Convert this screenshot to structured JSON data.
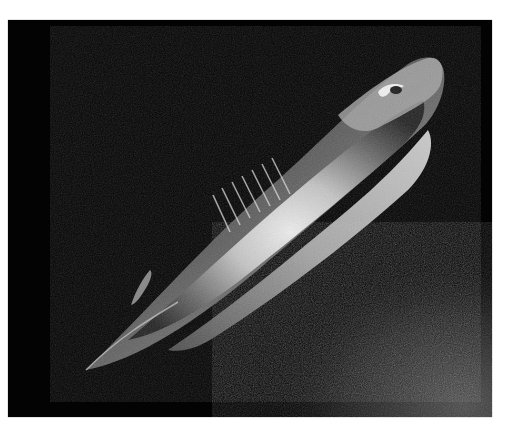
{
  "image": {
    "subject": "Sevengill shark swimming diagonally toward upper right against a dark sea background, rocky sea floor at lower right",
    "alt": "Sevengill shark photographed underwater at night",
    "colors": {
      "background": "#030303",
      "page": "#ffffff",
      "body_dark": "#3a3a3a",
      "body_mid": "#8a8a8a",
      "body_highlight": "#f2f2f2",
      "seafloor": "#2a2a2a"
    }
  }
}
